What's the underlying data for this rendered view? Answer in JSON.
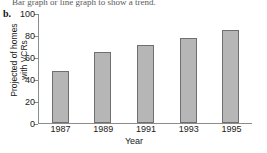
{
  "page": {
    "instruction": "Bar graph or line graph to show a trend.",
    "part_label": "b."
  },
  "chart_data": {
    "type": "bar",
    "title": "",
    "categories": [
      "1987",
      "1989",
      "1991",
      "1993",
      "1995"
    ],
    "values": [
      48,
      65,
      72,
      78,
      85
    ],
    "xlabel": "Year",
    "ylabel_lines": [
      "Projected of homes",
      "with VCRs"
    ],
    "ylabel": "Projected of homes with VCRs",
    "ylim": [
      0,
      100
    ],
    "yticks": [
      100,
      80,
      60,
      40,
      20,
      0
    ],
    "grid": false,
    "legend": false,
    "colors": {
      "bar_fill": "#b6b6b6",
      "bar_border": "#6f6f6f",
      "axis": "#8c8c8c",
      "text": "#1a1a1a"
    }
  }
}
